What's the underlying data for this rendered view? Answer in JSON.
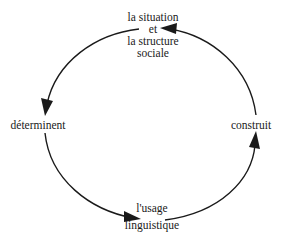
{
  "diagram": {
    "type": "cycle",
    "direction": "counterclockwise",
    "nodes": [
      {
        "id": "top",
        "position": "top",
        "lines": [
          "la situation",
          "et",
          "la structure",
          "sociale"
        ]
      },
      {
        "id": "left",
        "position": "left",
        "lines": [
          "déterminent"
        ]
      },
      {
        "id": "bottom",
        "position": "bottom",
        "lines": [
          "l'usage",
          "linguistique"
        ]
      },
      {
        "id": "right",
        "position": "right",
        "lines": [
          "construit"
        ]
      }
    ],
    "edges": [
      {
        "from": "top",
        "to": "left",
        "arrowhead": "at-left"
      },
      {
        "from": "left",
        "to": "bottom",
        "arrowhead": "at-bottom"
      },
      {
        "from": "bottom",
        "to": "right",
        "arrowhead": "at-right"
      },
      {
        "from": "right",
        "to": "top",
        "arrowhead": "at-top"
      }
    ],
    "colors": {
      "stroke": "#1a1a1a",
      "text": "#1a1a1a",
      "background": "#ffffff"
    }
  }
}
